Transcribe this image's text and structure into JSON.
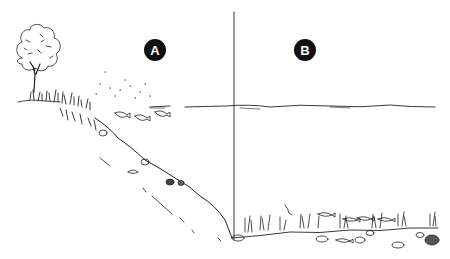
{
  "diagram": {
    "type": "lake-cross-section-illustration",
    "zones": [
      {
        "id": "A",
        "label": "A",
        "description": "littoral / shoreline slope zone with tree, reeds and fish near shore"
      },
      {
        "id": "B",
        "label": "B",
        "description": "open water zone with lake bottom plants, rocks and fish"
      }
    ],
    "elements": {
      "tree": "tree-icon",
      "water_surface": "water-line",
      "divider": "vertical-divider-line",
      "slope": "shore-slope",
      "fish": "fish-icon",
      "plants": "aquatic-plant-icon",
      "rocks": "rock-icon"
    },
    "colors": {
      "ink": "#222222",
      "label_bg": "#111111",
      "label_text": "#ffffff",
      "background": "#ffffff"
    }
  }
}
